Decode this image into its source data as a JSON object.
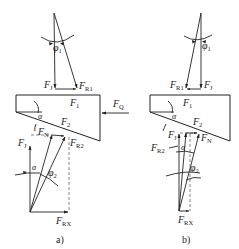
{
  "figure": {
    "panel_a": {
      "caption": "a)",
      "top": {
        "FJ": "F",
        "FJ_sub": "J",
        "FR1": "F",
        "FR1_sub": "R1",
        "phi1": "φ",
        "phi1_sub": "1"
      },
      "block": {
        "F1": "F",
        "F1_sub": "1",
        "F2": "F",
        "F2_sub": "2",
        "alpha": "α",
        "FQ": "F",
        "FQ_sub": "Q"
      },
      "bottom": {
        "FJ": "F",
        "FJ_sub": "J",
        "FN": "F",
        "FN_sub": "N",
        "FR2": "F",
        "FR2_sub": "R2",
        "alpha": "α",
        "phi2": "φ",
        "phi2_sub": "2",
        "FRX": "F",
        "FRX_sub": "RX"
      }
    },
    "panel_b": {
      "caption": "b)",
      "top": {
        "FR1": "F",
        "FR1_sub": "R1",
        "FJ": "F",
        "FJ_sub": "J",
        "phi1": "φ",
        "phi1_sub": "1"
      },
      "block": {
        "F1": "F",
        "F1_sub": "1",
        "F2": "F",
        "F2_sub": "2",
        "alpha": "α"
      },
      "bottom": {
        "FJ": "F",
        "FJ_sub": "J",
        "FR2": "F",
        "FR2_sub": "R2",
        "FN": "F",
        "FN_sub": "N",
        "alpha": "α",
        "phi2": "φ",
        "phi2_sub": "2",
        "FRX": "F",
        "FRX_sub": "RX"
      }
    }
  }
}
